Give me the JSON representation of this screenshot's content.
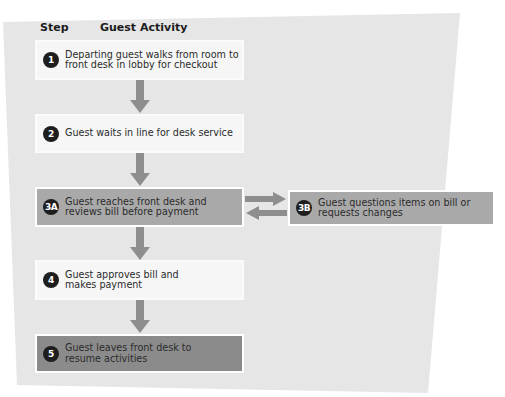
{
  "header": {
    "step_label": "Step",
    "activity_label": "Guest Activity"
  },
  "colors": {
    "panel": "#e6e6e6",
    "light_box": "#f6f6f6",
    "mid_box": "#a9a9a9",
    "dark_box": "#8b8b8b",
    "arrow": "#8e8e8e",
    "badge": "#1e1e1e"
  },
  "steps": [
    {
      "id": "1",
      "text": "Departing guest walks from room to front desk in lobby for checkout"
    },
    {
      "id": "2",
      "text": "Guest waits in line for desk service"
    },
    {
      "id": "3A",
      "text": "Guest reaches front desk and reviews bill before payment"
    },
    {
      "id": "3B",
      "text": "Guest questions items on bill or requests changes"
    },
    {
      "id": "4",
      "text": "Guest approves bill and makes payment"
    },
    {
      "id": "5",
      "text": "Guest leaves front desk to resume activities"
    }
  ],
  "flow": [
    {
      "from": "1",
      "to": "2"
    },
    {
      "from": "2",
      "to": "3A"
    },
    {
      "from": "3A",
      "to": "3B"
    },
    {
      "from": "3B",
      "to": "3A"
    },
    {
      "from": "3A",
      "to": "4"
    },
    {
      "from": "4",
      "to": "5"
    }
  ]
}
